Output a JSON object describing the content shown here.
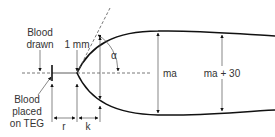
{
  "diagram": {
    "type": "thromboelastography (TEG) tracing schematic",
    "labels": {
      "blood_drawn_line1": "Blood",
      "blood_drawn_line2": "drawn",
      "one_mm": "1 mm",
      "alpha": "α",
      "blood_placed_line1": "Blood",
      "blood_placed_line2": "placed",
      "blood_placed_line3": "on TEG",
      "r": "r",
      "k": "k",
      "ma": "ma",
      "ma_plus_30": "ma + 30"
    },
    "colors": {
      "line": "#111111",
      "thin_line": "#555555",
      "text": "#333333"
    }
  }
}
